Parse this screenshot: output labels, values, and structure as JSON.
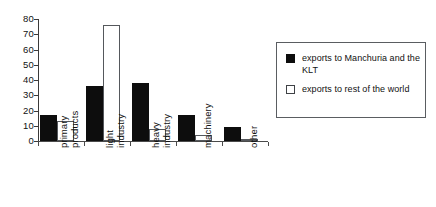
{
  "chart_data": {
    "type": "bar",
    "title": "",
    "xlabel": "",
    "ylabel": "",
    "ylim": [
      0,
      80
    ],
    "yticks": [
      0,
      10,
      20,
      30,
      40,
      50,
      60,
      70,
      80
    ],
    "ytick_labels": [
      "0",
      "10",
      "20",
      "30",
      "40",
      "50",
      "60",
      "70",
      "80"
    ],
    "grid": false,
    "legend_position": "right",
    "categories": [
      "primary products",
      "light industry",
      "heavy industry",
      "machinery",
      "other"
    ],
    "category_lines": [
      [
        "primary",
        "products"
      ],
      [
        "light",
        "industry"
      ],
      [
        "heavy",
        "industry"
      ],
      [
        "machinery"
      ],
      [
        "other"
      ]
    ],
    "series": [
      {
        "name": "exports to Manchuria and the KLT",
        "color": "#0d0d0d",
        "values": [
          17,
          36,
          38,
          17,
          9
        ]
      },
      {
        "name": "exports to rest of the world",
        "color": "#ffffff",
        "values": [
          13,
          76,
          8,
          4,
          1
        ]
      }
    ]
  },
  "legend": {
    "entries": [
      {
        "label": "exports to Manchuria and the KLT",
        "swatch": "dark"
      },
      {
        "label": "exports to rest of the world",
        "swatch": "light"
      }
    ]
  }
}
